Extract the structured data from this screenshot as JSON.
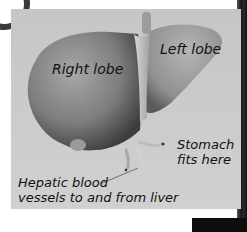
{
  "diagram": {
    "labels": {
      "right_lobe": "Right lobe",
      "left_lobe": "Left lobe",
      "stomach_line1": "Stomach",
      "stomach_line2": "fits here",
      "hepatic_line1": "Hepatic blood",
      "hepatic_line2": "vessels to and from liver"
    },
    "colors": {
      "panel_bg": "#c9c9c9",
      "liver_shade": "#8a8a8a",
      "text": "#111111"
    }
  }
}
